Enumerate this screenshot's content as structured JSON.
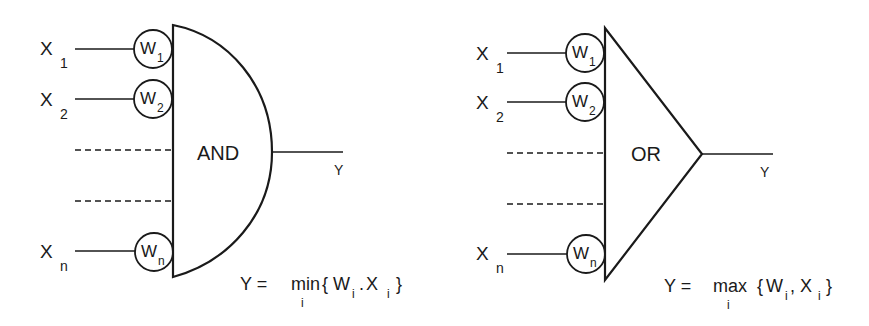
{
  "diagram": {
    "and_gate": {
      "label": "AND",
      "inputs": [
        {
          "var": "X",
          "var_sub": "1",
          "weight": "W",
          "weight_sub": "1"
        },
        {
          "var": "X",
          "var_sub": "2",
          "weight": "W",
          "weight_sub": "2"
        },
        {
          "var": "X",
          "var_sub": "n",
          "weight": "W",
          "weight_sub": "n"
        }
      ],
      "output_label": "Y",
      "formula": {
        "lhs": "Y =",
        "op": "min",
        "op_sub": "i",
        "open": "{",
        "w": "W",
        "w_sub": "i",
        "sep": ".",
        "x": "X",
        "x_sub": "i",
        "close": "}"
      }
    },
    "or_gate": {
      "label": "OR",
      "inputs": [
        {
          "var": "X",
          "var_sub": "1",
          "weight": "W",
          "weight_sub": "1"
        },
        {
          "var": "X",
          "var_sub": "2",
          "weight": "W",
          "weight_sub": "2"
        },
        {
          "var": "X",
          "var_sub": "n",
          "weight": "W",
          "weight_sub": "n"
        }
      ],
      "output_label": "Y",
      "formula": {
        "lhs": "Y =",
        "op": "max",
        "op_sub": "i",
        "open": "{",
        "w": "W",
        "w_sub": "i",
        "sep": ",",
        "x": "X",
        "x_sub": "i",
        "close": "}"
      }
    },
    "colors": {
      "ink": "#1a1a1a",
      "background": "#ffffff"
    }
  }
}
